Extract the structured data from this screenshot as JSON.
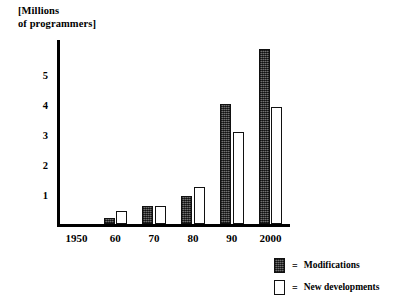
{
  "chart_data": {
    "type": "bar",
    "title_line1": "[Millions",
    "title_line2": "of programmers]",
    "xlabel": "",
    "ylabel": "[Millions of programmers]",
    "categories": [
      "1950",
      "60",
      "70",
      "80",
      "90",
      "2000"
    ],
    "xtick_labels": [
      "1950",
      "60",
      "70",
      "80",
      "90",
      "2000"
    ],
    "ytick_labels": [
      "1",
      "2",
      "3",
      "4",
      "5"
    ],
    "ytick_values": [
      1,
      2,
      3,
      4,
      5
    ],
    "ylim": [
      0,
      6.1
    ],
    "xlim_categories": 6,
    "grid": false,
    "legend_position": "bottom-right",
    "series": [
      {
        "name": "Modifications",
        "color": "#4a4a4a",
        "values": [
          0,
          0.2,
          0.6,
          0.95,
          4.0,
          5.8
        ]
      },
      {
        "name": "New developments",
        "color": "#ffffff",
        "values": [
          0,
          0.45,
          0.6,
          1.25,
          3.05,
          3.9
        ]
      }
    ]
  },
  "legend": {
    "equals": "=",
    "entries": [
      {
        "label": "Modifications",
        "swatch": "filled-dark-swatch"
      },
      {
        "label": "New developments",
        "swatch": "outline-white-swatch"
      }
    ]
  }
}
